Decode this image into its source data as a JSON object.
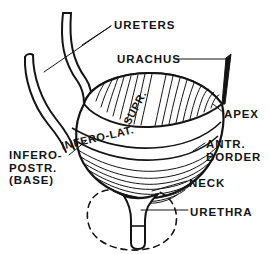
{
  "figure": {
    "background_color": "#ffffff",
    "ink_color": "#141414",
    "labels": {
      "ureters": "URETERS",
      "urachus": "URACHUS",
      "apex": "APEX",
      "antr_border": "ANTR.\nBORDER",
      "neck": "NECK",
      "urethra": "URETHRA",
      "infero_postr_base": "INFERO-\nPOSTR.\n(BASE)",
      "supr": "SUPR.",
      "infero_lat": "INFERO-LAT."
    },
    "parts": {
      "ureter_left": "left-ureter-tube",
      "ureter_right": "right-ureter-tube",
      "urachus_cord": "urachus-cord",
      "bladder_body": "bladder-body",
      "superior_surface": "superior-surface",
      "inferolateral_surface": "inferolateral-surface",
      "bladder_neck": "bladder-neck",
      "urethra_tube": "urethra-tube",
      "prostate_outline": "prostate-dashed-outline"
    }
  }
}
